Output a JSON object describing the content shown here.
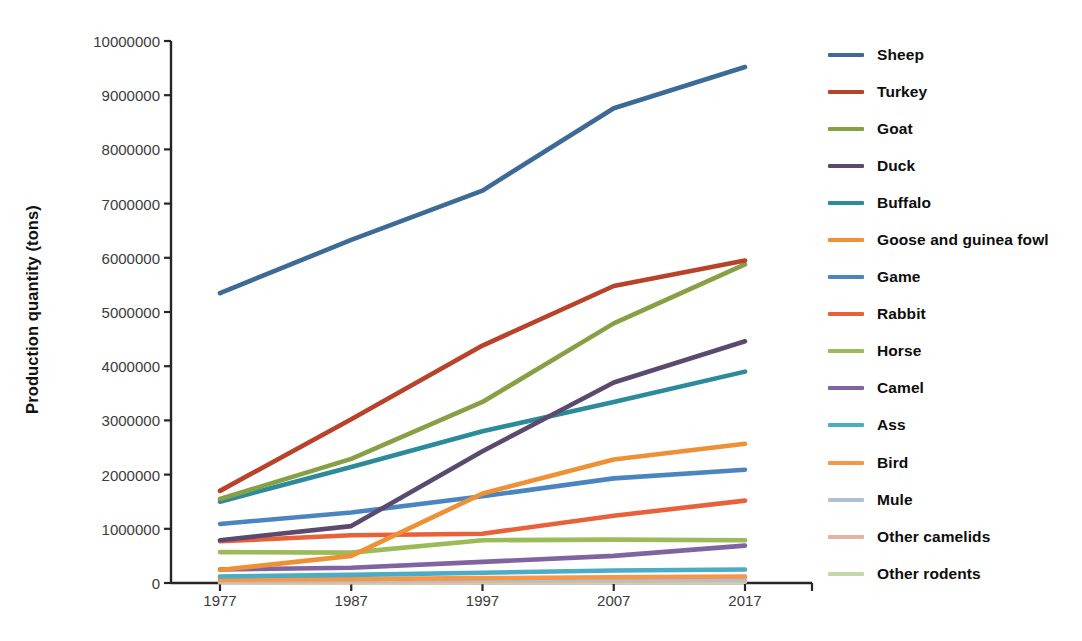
{
  "chart_data": {
    "type": "line",
    "title": "",
    "xlabel": "",
    "ylabel": "Production quantity (tons)",
    "categories": [
      "1977",
      "1987",
      "1997",
      "2007",
      "2017"
    ],
    "x": [
      1977,
      1987,
      1997,
      2007,
      2017
    ],
    "ylim": [
      0,
      10000000
    ],
    "ytick_labels": [
      "0",
      "1000000",
      "2000000",
      "3000000",
      "4000000",
      "5000000",
      "6000000",
      "7000000",
      "8000000",
      "9000000",
      "10000000"
    ],
    "yticks": [
      0,
      1000000,
      2000000,
      3000000,
      4000000,
      5000000,
      6000000,
      7000000,
      8000000,
      9000000,
      10000000
    ],
    "grid": false,
    "legend_position": "right",
    "series": [
      {
        "name": "Sheep",
        "color": "#3D6A96",
        "values": [
          5350000,
          6330000,
          7240000,
          8760000,
          9520000
        ]
      },
      {
        "name": "Turkey",
        "color": "#B8422A",
        "values": [
          1700000,
          3020000,
          4380000,
          5480000,
          5950000
        ]
      },
      {
        "name": "Goat",
        "color": "#88A045",
        "values": [
          1550000,
          2290000,
          3340000,
          4790000,
          5880000
        ]
      },
      {
        "name": "Duck",
        "color": "#5B4A6E",
        "values": [
          790000,
          1050000,
          2430000,
          3700000,
          4460000
        ]
      },
      {
        "name": "Buffalo",
        "color": "#2C8B9B",
        "values": [
          1500000,
          2140000,
          2800000,
          3340000,
          3900000
        ]
      },
      {
        "name": "Goose and guinea fowl",
        "color": "#EE9034",
        "values": [
          240000,
          500000,
          1650000,
          2280000,
          2570000
        ]
      },
      {
        "name": "Game",
        "color": "#4B85C0",
        "values": [
          1090000,
          1300000,
          1600000,
          1930000,
          2090000
        ]
      },
      {
        "name": "Rabbit",
        "color": "#E8613B",
        "values": [
          770000,
          880000,
          910000,
          1240000,
          1520000
        ]
      },
      {
        "name": "Horse",
        "color": "#9BBB59",
        "values": [
          570000,
          560000,
          790000,
          800000,
          790000
        ]
      },
      {
        "name": "Camel",
        "color": "#8064A2",
        "values": [
          250000,
          280000,
          390000,
          500000,
          690000
        ]
      },
      {
        "name": "Ass",
        "color": "#4BACC6",
        "values": [
          120000,
          150000,
          190000,
          230000,
          250000
        ]
      },
      {
        "name": "Bird",
        "color": "#F79646",
        "values": [
          60000,
          75000,
          90000,
          105000,
          120000
        ]
      },
      {
        "name": "Mule",
        "color": "#AEC0D5",
        "values": [
          50000,
          58000,
          62000,
          66000,
          70000
        ]
      },
      {
        "name": "Other camelids",
        "color": "#E6B3A3",
        "values": [
          28000,
          33000,
          38000,
          44000,
          50000
        ]
      },
      {
        "name": "Other rodents",
        "color": "#C4D8A8",
        "values": [
          14000,
          16000,
          19000,
          22000,
          25000
        ]
      }
    ]
  },
  "axis": {
    "y_title": "Production quantity (tons)"
  }
}
